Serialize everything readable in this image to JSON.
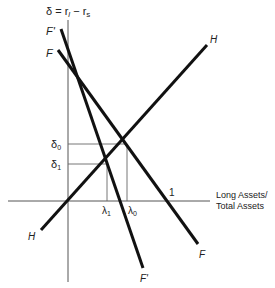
{
  "diagram": {
    "y_axis_label": "δ = r",
    "y_axis_label_sub1": "l",
    "y_axis_label_mid": " − r",
    "y_axis_label_sub2": "s",
    "x_axis_label_line1": "Long Assets/",
    "x_axis_label_line2": "Total Assets",
    "tick_one": "1",
    "delta0": "δ",
    "delta0_sub": "0",
    "delta1": "δ",
    "delta1_sub": "1",
    "lambda1": "λ",
    "lambda1_sub": "1",
    "lambda0": "λ",
    "lambda0_sub": "0",
    "curves": {
      "H_top": "H",
      "H_bottom": "H",
      "F_top": "F",
      "F_bottom": "F",
      "Fprime_top": "F'",
      "Fprime_bottom": "F'"
    },
    "colors": {
      "line": "#111111",
      "axis": "#444444",
      "guide": "#666666"
    }
  }
}
